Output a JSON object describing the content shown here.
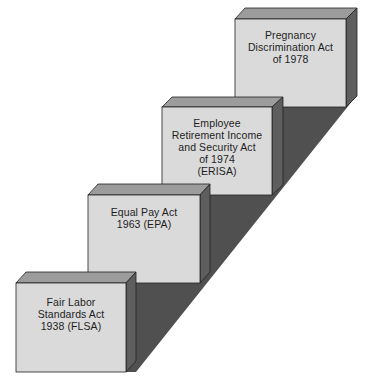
{
  "diagram": {
    "type": "ascending-staircase",
    "colors": {
      "front_face": "#d9d9d9",
      "top_face": "#9a9a9a",
      "side_face": "#5c5c5c",
      "shadow": "#4f4f4f",
      "edge": "#222222",
      "text": "#1e1e1e"
    },
    "steps": [
      {
        "order": 1,
        "lines": [
          "Fair Labor",
          "Standards Act",
          "1938 (FLSA)"
        ]
      },
      {
        "order": 2,
        "lines": [
          "Equal Pay Act",
          "1963 (EPA)"
        ]
      },
      {
        "order": 3,
        "lines": [
          "Employee",
          "Retirement Income",
          "and Security Act",
          "of 1974",
          "(ERISA)"
        ]
      },
      {
        "order": 4,
        "lines": [
          "Pregnancy",
          "Discrimination Act",
          "of 1978"
        ]
      }
    ]
  }
}
